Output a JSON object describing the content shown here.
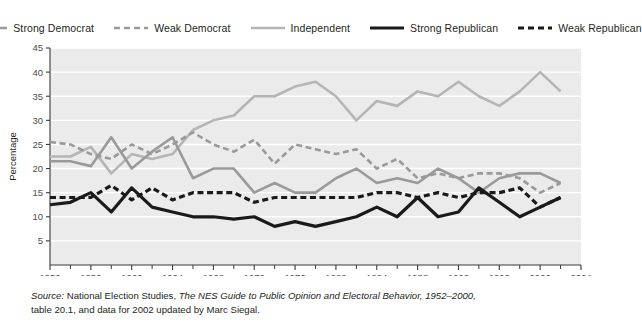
{
  "legend": {
    "items": [
      {
        "label": "Strong Democrat",
        "style": "solid",
        "color": "#9a9a9a",
        "width": 2.6,
        "icon": "line-solid-icon"
      },
      {
        "label": "Weak Democrat",
        "style": "dashed",
        "color": "#9a9a9a",
        "width": 2.6,
        "icon": "line-dashed-icon"
      },
      {
        "label": "Independent",
        "style": "solid",
        "color": "#b5b5b5",
        "width": 2.6,
        "icon": "line-solid-icon"
      },
      {
        "label": "Strong Republican",
        "style": "solid",
        "color": "#1a1a1a",
        "width": 3.2,
        "icon": "line-solid-icon"
      },
      {
        "label": "Weak Republican",
        "style": "dashed",
        "color": "#1a1a1a",
        "width": 3.2,
        "icon": "line-dashed-icon"
      }
    ]
  },
  "source": {
    "line1_pre": "Source:",
    "line1_mid": " National Election Studies, ",
    "line1_italic": "The NES Guide to Public Opinion and Electoral Behavior, 1952–2000,",
    "line2": "table 20.1, and data for 2002 updated by Marc Siegal."
  },
  "chart_data": {
    "type": "line",
    "title": "",
    "xlabel": "",
    "ylabel": "Percentage",
    "xlim": [
      1952,
      2004
    ],
    "ylim": [
      0,
      45
    ],
    "ytick_step": 5,
    "yticks": [
      5,
      10,
      15,
      20,
      25,
      30,
      35,
      40,
      45
    ],
    "ytick_labels": [
      "5",
      "10",
      "15",
      "20",
      "25",
      "30",
      "35",
      "40",
      "45"
    ],
    "xticks_major": [
      1952,
      1956,
      1960,
      1964,
      1968,
      1972,
      1976,
      1980,
      1984,
      1988,
      1992,
      1996,
      2000,
      2004
    ],
    "xtick_labels": [
      "1952",
      "1956",
      "1960",
      "1964",
      "1968",
      "1972",
      "1976",
      "1980",
      "1984",
      "1988",
      "1992",
      "1996",
      "2000",
      "2004"
    ],
    "xticks_minor": [
      1954,
      1958,
      1962,
      1966,
      1970,
      1974,
      1978,
      1982,
      1986,
      1990,
      1994,
      1998,
      2002
    ],
    "grid": "horizontal",
    "grid_color": "#ffffff",
    "plot_background": "#ebebeb",
    "legend_position": "top",
    "x": [
      1952,
      1954,
      1956,
      1958,
      1960,
      1962,
      1964,
      1966,
      1968,
      1970,
      1972,
      1974,
      1976,
      1978,
      1980,
      1982,
      1984,
      1986,
      1988,
      1990,
      1992,
      1994,
      1996,
      1998,
      2000,
      2002
    ],
    "series": [
      {
        "name": "Strong Democrat",
        "color": "#9a9a9a",
        "style": "solid",
        "width": 2.6,
        "values": [
          21.5,
          21.5,
          20.5,
          26.5,
          20.0,
          23.5,
          26.5,
          18.0,
          20.0,
          20.0,
          15.0,
          17.0,
          15.0,
          15.0,
          18.0,
          20.0,
          17.0,
          18.0,
          17.0,
          20.0,
          18.0,
          15.0,
          18.0,
          19.0,
          19.0,
          17.0
        ]
      },
      {
        "name": "Weak Democrat",
        "color": "#9a9a9a",
        "style": "dashed",
        "width": 2.6,
        "values": [
          25.5,
          25.0,
          23.0,
          22.0,
          25.0,
          23.0,
          25.0,
          27.5,
          25.0,
          23.5,
          26.0,
          21.0,
          25.0,
          24.0,
          23.0,
          24.0,
          20.0,
          22.0,
          18.0,
          19.0,
          18.0,
          19.0,
          19.0,
          18.0,
          15.0,
          17.0
        ]
      },
      {
        "name": "Independent",
        "color": "#b5b5b5",
        "style": "solid",
        "width": 2.6,
        "values": [
          22.5,
          22.5,
          24.5,
          19.0,
          23.0,
          22.0,
          23.0,
          28.0,
          30.0,
          31.0,
          35.0,
          35.0,
          37.0,
          38.0,
          35.0,
          30.0,
          34.0,
          33.0,
          36.0,
          35.0,
          38.0,
          35.0,
          33.0,
          36.0,
          40.0,
          36.0
        ]
      },
      {
        "name": "Strong Republican",
        "color": "#1a1a1a",
        "style": "solid",
        "width": 3.2,
        "values": [
          12.5,
          13.0,
          15.0,
          11.0,
          16.0,
          12.0,
          11.0,
          10.0,
          10.0,
          9.5,
          10.0,
          8.0,
          9.0,
          8.0,
          9.0,
          10.0,
          12.0,
          10.0,
          14.0,
          10.0,
          11.0,
          16.0,
          13.0,
          10.0,
          12.0,
          14.0
        ]
      },
      {
        "name": "Weak Republican",
        "color": "#1a1a1a",
        "style": "dashed",
        "width": 3.2,
        "values": [
          14.0,
          14.0,
          14.0,
          16.5,
          13.5,
          16.0,
          13.5,
          15.0,
          15.0,
          15.0,
          13.0,
          14.0,
          14.0,
          14.0,
          14.0,
          14.0,
          15.0,
          15.0,
          14.0,
          15.0,
          14.0,
          15.0,
          15.0,
          16.0,
          12.0,
          14.0
        ]
      }
    ]
  }
}
